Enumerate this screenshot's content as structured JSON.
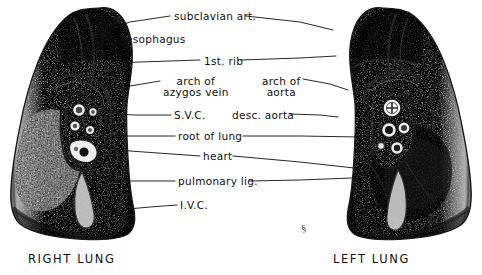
{
  "figure": {
    "title_text": "",
    "background_color": "#ffffff",
    "ink_color": "#101010",
    "signature": "§",
    "captions": [
      {
        "id": "right-lung-caption",
        "text": "RIGHT LUNG",
        "x": 28,
        "y": 252
      },
      {
        "id": "left-lung-caption",
        "text": "LEFT LUNG",
        "x": 333,
        "y": 252
      }
    ],
    "labels": [
      {
        "id": "subclavian-art",
        "text": "subclavian art.",
        "x": 174,
        "y": 11,
        "align": "left",
        "lines": 1
      },
      {
        "id": "esophagus",
        "text": "esophagus",
        "x": 126,
        "y": 34,
        "align": "left",
        "lines": 1
      },
      {
        "id": "first-rib",
        "text": "1st. rib",
        "x": 204,
        "y": 56,
        "align": "left",
        "lines": 1
      },
      {
        "id": "arch-of-azygos-vein",
        "text": "arch of\nazygos vein",
        "x": 163,
        "y": 76,
        "align": "left",
        "lines": 2
      },
      {
        "id": "arch-of-aorta",
        "text": "arch of\naorta",
        "x": 262,
        "y": 76,
        "align": "left",
        "lines": 2
      },
      {
        "id": "svc",
        "text": "S.V.C.",
        "x": 174,
        "y": 110,
        "align": "left",
        "lines": 1
      },
      {
        "id": "desc-aorta",
        "text": "desc. aorta",
        "x": 232,
        "y": 110,
        "align": "left",
        "lines": 1
      },
      {
        "id": "root-of-lung",
        "text": "root of lung",
        "x": 178,
        "y": 131,
        "align": "left",
        "lines": 1
      },
      {
        "id": "heart",
        "text": "heart",
        "x": 203,
        "y": 151,
        "align": "left",
        "lines": 1
      },
      {
        "id": "pulmonary-lig",
        "text": "pulmonary lig.",
        "x": 178,
        "y": 176,
        "align": "left",
        "lines": 1
      },
      {
        "id": "ivc",
        "text": "I.V.C.",
        "x": 180,
        "y": 200,
        "align": "left",
        "lines": 1
      }
    ],
    "leader_lines": [
      {
        "id": "leader-subclavian-left",
        "points": "170,16 130,22 113,28"
      },
      {
        "id": "leader-subclavian-right",
        "points": "246,16 300,22 333,30"
      },
      {
        "id": "leader-esophagus",
        "points": "122,38 100,42 85,44"
      },
      {
        "id": "leader-first-rib-left",
        "points": "200,60 140,62 119,63"
      },
      {
        "id": "leader-first-rib-right",
        "points": "241,60 300,58 336,56"
      },
      {
        "id": "leader-azygos",
        "points": "160,81 130,86 112,90"
      },
      {
        "id": "leader-arch-aorta",
        "points": "303,79 330,84 348,90"
      },
      {
        "id": "leader-svc",
        "points": "171,115 135,115 116,114"
      },
      {
        "id": "leader-desc-aorta",
        "points": "290,114 320,115 338,117"
      },
      {
        "id": "leader-root-left",
        "points": "175,136 130,136 112,136"
      },
      {
        "id": "leader-root-right",
        "points": "243,136 300,136 360,137"
      },
      {
        "id": "leader-heart-left",
        "points": "200,156 130,151 105,147"
      },
      {
        "id": "leader-heart-right",
        "points": "233,156 300,162 372,170"
      },
      {
        "id": "leader-pulm-left",
        "points": "175,181 130,181 110,181"
      },
      {
        "id": "leader-pulm-right",
        "points": "249,181 300,180 352,178"
      },
      {
        "id": "leader-ivc",
        "points": "177,205 150,207 128,209"
      }
    ],
    "organs": [
      {
        "id": "right-lung",
        "name": "right lung medial surface"
      },
      {
        "id": "left-lung",
        "name": "left lung medial surface"
      }
    ]
  }
}
